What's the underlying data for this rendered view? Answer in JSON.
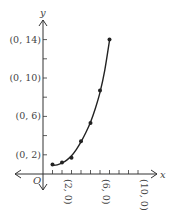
{
  "chart_data": {
    "type": "scatter",
    "title": "",
    "xlabel": "x",
    "ylabel": "y",
    "origin_label": "O",
    "xlim": [
      -3,
      12
    ],
    "ylim": [
      -1.7,
      16
    ],
    "grid": false,
    "legend": null,
    "x_ticks": [
      1,
      2,
      3,
      4,
      5,
      6,
      7,
      8,
      9,
      10
    ],
    "y_ticks": [
      2,
      4,
      6,
      8,
      10,
      12,
      14
    ],
    "x_tick_labels": [
      {
        "value": 2,
        "label": "(2, 0)"
      },
      {
        "value": 6,
        "label": "(6, 0)"
      },
      {
        "value": 10,
        "label": "(10, 0)"
      }
    ],
    "y_tick_labels": [
      {
        "value": 2,
        "label": "(0, 2)"
      },
      {
        "value": 6,
        "label": "(0, 6)"
      },
      {
        "value": 10,
        "label": "(0, 10)"
      },
      {
        "value": 14,
        "label": "(0, 14)"
      }
    ],
    "series": [
      {
        "name": "data points",
        "type": "scatter",
        "points": [
          [
            1,
            1.0
          ],
          [
            2,
            1.2
          ],
          [
            3,
            1.7
          ],
          [
            4,
            3.4
          ],
          [
            5,
            5.3
          ],
          [
            6,
            8.7
          ],
          [
            7,
            14.0
          ]
        ]
      },
      {
        "name": "fitted curve",
        "type": "line",
        "points": [
          [
            1,
            0.9
          ],
          [
            1.5,
            0.95
          ],
          [
            2,
            1.15
          ],
          [
            2.5,
            1.45
          ],
          [
            3,
            1.9
          ],
          [
            3.5,
            2.55
          ],
          [
            4,
            3.35
          ],
          [
            4.5,
            4.3
          ],
          [
            5,
            5.4
          ],
          [
            5.5,
            6.8
          ],
          [
            6,
            8.5
          ],
          [
            6.5,
            10.8
          ],
          [
            7,
            13.9
          ]
        ]
      }
    ],
    "colors": {
      "ink": "#333333",
      "background": "#ffffff"
    }
  }
}
